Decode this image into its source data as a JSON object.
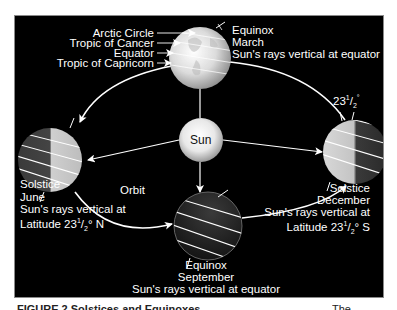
{
  "diagram": {
    "type": "earth-orbit-seasons",
    "background_color": "#000000",
    "foreground_color": "#ffffff",
    "center": {
      "label": "Sun"
    },
    "orbit_label": "Orbit",
    "latitude_labels": {
      "arctic_circle": "Arctic Circle",
      "tropic_of_cancer": "Tropic of Cancer",
      "equator": "Equator",
      "tropic_of_capricorn": "Tropic of Capricorn"
    },
    "tilt_label": {
      "whole": "23",
      "num": "1",
      "den": "2",
      "unit": "°"
    },
    "positions": {
      "march": {
        "event": "Equinox",
        "month": "March",
        "description": "Sun's rays vertical at equator"
      },
      "june": {
        "event": "Solstice",
        "month": "June",
        "description": "Sun's rays vertical at",
        "latitude_prefix": "Latitude 23",
        "latitude_num": "1",
        "latitude_den": "2",
        "latitude_suffix": "° N"
      },
      "september": {
        "event": "Equinox",
        "month": "September",
        "description": "Sun's rays vertical at equator"
      },
      "december": {
        "event": "Solstice",
        "month": "December",
        "description": "Sun's rays vertical at",
        "latitude_prefix": "Latitude 23",
        "latitude_num": "1",
        "latitude_den": "2",
        "latitude_suffix": "° S"
      }
    }
  },
  "caption": {
    "text": "FIGURE 2 Solstices and Equinoxes",
    "trailing_text": "The"
  }
}
